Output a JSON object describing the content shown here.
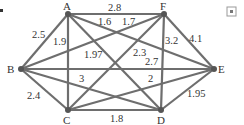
{
  "graph": {
    "nodes": [
      {
        "id": "A",
        "x": 68,
        "y": 14,
        "lx": 63,
        "ly": 10
      },
      {
        "id": "F",
        "x": 164,
        "y": 14,
        "lx": 160,
        "ly": 10
      },
      {
        "id": "B",
        "x": 21,
        "y": 69,
        "lx": 7,
        "ly": 73
      },
      {
        "id": "E",
        "x": 214,
        "y": 69,
        "lx": 218,
        "ly": 73
      },
      {
        "id": "C",
        "x": 68,
        "y": 110,
        "lx": 63,
        "ly": 124
      },
      {
        "id": "D",
        "x": 161,
        "y": 110,
        "lx": 157,
        "ly": 124
      }
    ],
    "edges": [
      {
        "from": "A",
        "to": "F",
        "weight": "2.8",
        "lx": 108,
        "ly": 11
      },
      {
        "from": "A",
        "to": "B",
        "weight": "2.5",
        "lx": 32,
        "ly": 38
      },
      {
        "from": "A",
        "to": "C",
        "weight": "1.9",
        "lx": 53,
        "ly": 45
      },
      {
        "from": "A",
        "to": "E",
        "weight": "1.6",
        "lx": 98,
        "ly": 25
      },
      {
        "from": "A",
        "to": "D",
        "weight": "1.97",
        "lx": 84,
        "ly": 58
      },
      {
        "from": "F",
        "to": "B",
        "weight": "1.7",
        "lx": 122,
        "ly": 25
      },
      {
        "from": "F",
        "to": "D",
        "weight": "3.2",
        "lx": 165,
        "ly": 44
      },
      {
        "from": "F",
        "to": "E",
        "weight": "4.1",
        "lx": 189,
        "ly": 42
      },
      {
        "from": "F",
        "to": "C",
        "weight": "2.3",
        "lx": 133,
        "ly": 56
      },
      {
        "from": "B",
        "to": "E",
        "weight": "2.7",
        "lx": 145,
        "ly": 65
      },
      {
        "from": "B",
        "to": "D",
        "weight": "3",
        "lx": 79,
        "ly": 82
      },
      {
        "from": "B",
        "to": "C",
        "weight": "2.4",
        "lx": 27,
        "ly": 99
      },
      {
        "from": "C",
        "to": "E",
        "weight": "2",
        "lx": 148,
        "ly": 82
      },
      {
        "from": "C",
        "to": "D",
        "weight": "1.8",
        "lx": 110,
        "ly": 122
      },
      {
        "from": "D",
        "to": "E",
        "weight": "1.95",
        "lx": 187,
        "ly": 97
      }
    ]
  },
  "corner_icon": "expand-icon"
}
